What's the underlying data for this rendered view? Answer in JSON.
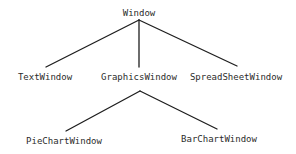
{
  "diagram": {
    "type": "class-hierarchy-tree",
    "line_color": "#1e1e1e",
    "text_color": "#2b2b2b",
    "root": {
      "label": "Window",
      "children": [
        {
          "label": "TextWindow",
          "children": []
        },
        {
          "label": "GraphicsWindow",
          "children": [
            {
              "label": "PieChartWindow",
              "children": []
            },
            {
              "label": "BarChartWindow",
              "children": []
            }
          ]
        },
        {
          "label": "SpreadSheetWindow",
          "children": []
        }
      ]
    },
    "nodes": {
      "window": "Window",
      "text_window": "TextWindow",
      "graphics_window": "GraphicsWindow",
      "spreadsheet_window": "SpreadSheetWindow",
      "piechart_window": "PieChartWindow",
      "barchart_window": "BarChartWindow"
    },
    "edges": [
      {
        "from": "Window",
        "to": "TextWindow"
      },
      {
        "from": "Window",
        "to": "GraphicsWindow"
      },
      {
        "from": "Window",
        "to": "SpreadSheetWindow"
      },
      {
        "from": "GraphicsWindow",
        "to": "PieChartWindow"
      },
      {
        "from": "GraphicsWindow",
        "to": "BarChartWindow"
      }
    ]
  }
}
